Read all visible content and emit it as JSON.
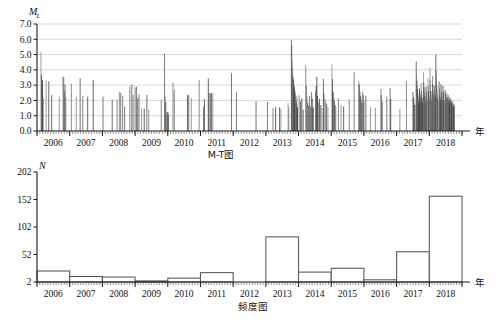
{
  "figure": {
    "x_unit_label": "年",
    "panels": [
      "M-T图",
      "频度图"
    ]
  },
  "chart_data": [
    {
      "type": "scatter",
      "id": "magnitude-time",
      "title": "M-T图",
      "caption": "M-T图",
      "xlabel": "年",
      "ylabel": "M",
      "ylabel_sub": "L",
      "ylim": [
        0,
        7
      ],
      "yticks": [
        "0.0",
        "1.0",
        "2.0",
        "3.0",
        "4.0",
        "5.0",
        "6.0",
        "7.0"
      ],
      "ytick_values": [
        0,
        1,
        2,
        3,
        4,
        5,
        6,
        7
      ],
      "xlim": [
        2005.5,
        2018.5
      ],
      "xticks": [
        "2006",
        "2007",
        "2008",
        "2009",
        "2010",
        "2011",
        "2012",
        "2013",
        "2014",
        "2015",
        "2016",
        "2017",
        "2018"
      ],
      "xtick_values": [
        2006,
        2007,
        2008,
        2009,
        2010,
        2011,
        2012,
        2013,
        2014,
        2015,
        2016,
        2017,
        2018
      ],
      "grid": "horizontal",
      "marker": "vertical-stem",
      "points": [
        [
          2005.62,
          5.15
        ],
        [
          2005.64,
          3.7
        ],
        [
          2005.66,
          3.35
        ],
        [
          2005.67,
          3.3
        ],
        [
          2005.69,
          2.15
        ],
        [
          2005.78,
          3.3
        ],
        [
          2005.86,
          3.25
        ],
        [
          2005.95,
          2.35
        ],
        [
          2006.18,
          2.25
        ],
        [
          2006.3,
          3.55
        ],
        [
          2006.32,
          3.5
        ],
        [
          2006.34,
          2.6
        ],
        [
          2006.36,
          3.05
        ],
        [
          2006.38,
          2.2
        ],
        [
          2006.55,
          3.1
        ],
        [
          2006.7,
          2.25
        ],
        [
          2006.82,
          3.45
        ],
        [
          2006.9,
          2.3
        ],
        [
          2007.05,
          2.25
        ],
        [
          2007.22,
          3.35
        ],
        [
          2007.52,
          2.25
        ],
        [
          2007.8,
          2.05
        ],
        [
          2007.95,
          2.05
        ],
        [
          2008.02,
          2.55
        ],
        [
          2008.06,
          2.5
        ],
        [
          2008.12,
          2.3
        ],
        [
          2008.18,
          1.6
        ],
        [
          2008.34,
          2.9
        ],
        [
          2008.4,
          3.05
        ],
        [
          2008.44,
          2.35
        ],
        [
          2008.5,
          2.85
        ],
        [
          2008.54,
          2.9
        ],
        [
          2008.58,
          2.15
        ],
        [
          2008.62,
          2.4
        ],
        [
          2008.7,
          1.5
        ],
        [
          2008.78,
          1.45
        ],
        [
          2008.86,
          2.35
        ],
        [
          2008.92,
          1.4
        ],
        [
          2009.3,
          2.05
        ],
        [
          2009.4,
          5.05
        ],
        [
          2009.42,
          2.25
        ],
        [
          2009.44,
          1.9
        ],
        [
          2009.46,
          1.25
        ],
        [
          2009.48,
          1.15
        ],
        [
          2009.5,
          1.25
        ],
        [
          2009.52,
          1.1
        ],
        [
          2009.66,
          3.15
        ],
        [
          2009.7,
          2.7
        ],
        [
          2010.1,
          2.35
        ],
        [
          2010.14,
          2.35
        ],
        [
          2010.22,
          2.15
        ],
        [
          2010.46,
          3.35
        ],
        [
          2010.6,
          1.6
        ],
        [
          2010.62,
          2.1
        ],
        [
          2010.74,
          3.45
        ],
        [
          2010.76,
          2.5
        ],
        [
          2010.8,
          2.45
        ],
        [
          2010.84,
          2.5
        ],
        [
          2010.88,
          2.45
        ],
        [
          2011.45,
          3.8
        ],
        [
          2011.6,
          2.55
        ],
        [
          2012.2,
          1.95
        ],
        [
          2012.55,
          1.9
        ],
        [
          2012.72,
          1.5
        ],
        [
          2012.8,
          1.55
        ],
        [
          2012.92,
          1.55
        ],
        [
          2012.96,
          1.45
        ],
        [
          2013.18,
          1.85
        ],
        [
          2013.2,
          1.55
        ],
        [
          2013.28,
          5.95
        ],
        [
          2013.29,
          5.6
        ],
        [
          2013.3,
          4.7
        ],
        [
          2013.31,
          4.2
        ],
        [
          2013.32,
          3.9
        ],
        [
          2013.33,
          3.6
        ],
        [
          2013.34,
          3.4
        ],
        [
          2013.35,
          3.3
        ],
        [
          2013.36,
          3.0
        ],
        [
          2013.37,
          2.9
        ],
        [
          2013.38,
          2.7
        ],
        [
          2013.39,
          2.55
        ],
        [
          2013.4,
          2.4
        ],
        [
          2013.41,
          2.25
        ],
        [
          2013.42,
          2.1
        ],
        [
          2013.43,
          1.95
        ],
        [
          2013.44,
          1.8
        ],
        [
          2013.45,
          2.3
        ],
        [
          2013.46,
          1.6
        ],
        [
          2013.47,
          1.5
        ],
        [
          2013.52,
          2.35
        ],
        [
          2013.56,
          1.95
        ],
        [
          2013.6,
          2.15
        ],
        [
          2013.64,
          1.4
        ],
        [
          2013.72,
          4.3
        ],
        [
          2013.74,
          2.95
        ],
        [
          2013.76,
          2.25
        ],
        [
          2013.78,
          1.9
        ],
        [
          2013.8,
          1.7
        ],
        [
          2013.84,
          2.3
        ],
        [
          2013.86,
          1.6
        ],
        [
          2013.9,
          2.55
        ],
        [
          2013.92,
          2.1
        ],
        [
          2013.94,
          1.55
        ],
        [
          2013.96,
          1.5
        ],
        [
          2014.02,
          2.6
        ],
        [
          2014.04,
          2.95
        ],
        [
          2014.06,
          3.55
        ],
        [
          2014.08,
          2.3
        ],
        [
          2014.1,
          1.85
        ],
        [
          2014.14,
          2.1
        ],
        [
          2014.18,
          1.7
        ],
        [
          2014.22,
          1.5
        ],
        [
          2014.26,
          3.4
        ],
        [
          2014.28,
          2.45
        ],
        [
          2014.32,
          2.05
        ],
        [
          2014.36,
          1.8
        ],
        [
          2014.4,
          1.55
        ],
        [
          2014.52,
          4.35
        ],
        [
          2014.54,
          3.4
        ],
        [
          2014.56,
          2.55
        ],
        [
          2014.58,
          2.2
        ],
        [
          2014.6,
          1.95
        ],
        [
          2014.62,
          1.7
        ],
        [
          2014.64,
          1.55
        ],
        [
          2014.72,
          2.15
        ],
        [
          2014.8,
          1.7
        ],
        [
          2014.88,
          1.6
        ],
        [
          2015.05,
          2.05
        ],
        [
          2015.2,
          3.85
        ],
        [
          2015.34,
          3.25
        ],
        [
          2015.36,
          3.05
        ],
        [
          2015.38,
          2.55
        ],
        [
          2015.4,
          2.3
        ],
        [
          2015.42,
          2.1
        ],
        [
          2015.44,
          1.85
        ],
        [
          2015.46,
          2.6
        ],
        [
          2015.48,
          2.35
        ],
        [
          2015.5,
          1.95
        ],
        [
          2015.56,
          2.3
        ],
        [
          2015.7,
          1.55
        ],
        [
          2015.85,
          1.5
        ],
        [
          2016.02,
          2.75
        ],
        [
          2016.04,
          2.35
        ],
        [
          2016.06,
          1.9
        ],
        [
          2016.2,
          2.25
        ],
        [
          2016.3,
          2.8
        ],
        [
          2016.32,
          2.1
        ],
        [
          2016.6,
          1.45
        ],
        [
          2016.8,
          3.25
        ],
        [
          2017.0,
          2.55
        ],
        [
          2017.02,
          2.2
        ],
        [
          2017.04,
          1.85
        ],
        [
          2017.06,
          1.7
        ],
        [
          2017.1,
          4.55
        ],
        [
          2017.11,
          3.7
        ],
        [
          2017.12,
          3.3
        ],
        [
          2017.13,
          3.0
        ],
        [
          2017.14,
          2.7
        ],
        [
          2017.15,
          2.45
        ],
        [
          2017.16,
          2.25
        ],
        [
          2017.17,
          2.05
        ],
        [
          2017.18,
          1.9
        ],
        [
          2017.19,
          1.75
        ],
        [
          2017.2,
          2.8
        ],
        [
          2017.21,
          2.5
        ],
        [
          2017.22,
          2.3
        ],
        [
          2017.23,
          2.1
        ],
        [
          2017.24,
          1.95
        ],
        [
          2017.25,
          3.15
        ],
        [
          2017.26,
          2.6
        ],
        [
          2017.27,
          2.35
        ],
        [
          2017.28,
          2.15
        ],
        [
          2017.29,
          1.85
        ],
        [
          2017.32,
          3.85
        ],
        [
          2017.33,
          3.2
        ],
        [
          2017.34,
          2.85
        ],
        [
          2017.35,
          2.5
        ],
        [
          2017.36,
          2.25
        ],
        [
          2017.37,
          2.0
        ],
        [
          2017.38,
          1.8
        ],
        [
          2017.4,
          2.9
        ],
        [
          2017.41,
          2.55
        ],
        [
          2017.42,
          2.3
        ],
        [
          2017.43,
          2.05
        ],
        [
          2017.44,
          1.85
        ],
        [
          2017.46,
          3.45
        ],
        [
          2017.47,
          2.95
        ],
        [
          2017.48,
          2.6
        ],
        [
          2017.49,
          2.3
        ],
        [
          2017.5,
          2.05
        ],
        [
          2017.52,
          4.15
        ],
        [
          2017.53,
          3.35
        ],
        [
          2017.54,
          2.95
        ],
        [
          2017.55,
          2.6
        ],
        [
          2017.56,
          2.35
        ],
        [
          2017.57,
          2.1
        ],
        [
          2017.58,
          1.9
        ],
        [
          2017.6,
          3.6
        ],
        [
          2017.61,
          3.05
        ],
        [
          2017.62,
          2.7
        ],
        [
          2017.63,
          2.4
        ],
        [
          2017.64,
          2.15
        ],
        [
          2017.66,
          2.95
        ],
        [
          2017.67,
          2.55
        ],
        [
          2017.68,
          2.25
        ],
        [
          2017.7,
          5.0
        ],
        [
          2017.71,
          3.95
        ],
        [
          2017.72,
          3.35
        ],
        [
          2017.73,
          2.95
        ],
        [
          2017.74,
          2.6
        ],
        [
          2017.75,
          2.35
        ],
        [
          2017.76,
          2.1
        ],
        [
          2017.77,
          1.9
        ],
        [
          2017.8,
          3.25
        ],
        [
          2017.81,
          2.8
        ],
        [
          2017.82,
          2.45
        ],
        [
          2017.83,
          2.2
        ],
        [
          2017.84,
          2.0
        ],
        [
          2017.86,
          3.05
        ],
        [
          2017.87,
          2.6
        ],
        [
          2017.88,
          2.3
        ],
        [
          2017.89,
          2.05
        ],
        [
          2017.9,
          1.85
        ],
        [
          2017.92,
          2.95
        ],
        [
          2017.93,
          2.55
        ],
        [
          2017.94,
          2.25
        ],
        [
          2017.95,
          2.0
        ],
        [
          2017.96,
          1.8
        ],
        [
          2017.98,
          2.7
        ],
        [
          2017.99,
          2.4
        ],
        [
          2018.0,
          2.6
        ],
        [
          2018.01,
          2.3
        ],
        [
          2018.02,
          2.05
        ],
        [
          2018.03,
          1.85
        ],
        [
          2018.04,
          2.45
        ],
        [
          2018.05,
          2.2
        ],
        [
          2018.06,
          2.0
        ],
        [
          2018.07,
          1.8
        ],
        [
          2018.08,
          2.35
        ],
        [
          2018.09,
          2.1
        ],
        [
          2018.1,
          1.9
        ],
        [
          2018.11,
          2.25
        ],
        [
          2018.12,
          2.0
        ],
        [
          2018.13,
          1.8
        ],
        [
          2018.14,
          2.15
        ],
        [
          2018.15,
          1.95
        ],
        [
          2018.16,
          1.75
        ],
        [
          2018.17,
          2.05
        ],
        [
          2018.18,
          1.85
        ],
        [
          2018.19,
          1.7
        ],
        [
          2018.2,
          1.95
        ],
        [
          2018.21,
          1.75
        ],
        [
          2018.22,
          1.6
        ],
        [
          2018.23,
          1.85
        ],
        [
          2018.24,
          1.65
        ],
        [
          2018.25,
          1.55
        ],
        [
          2018.26,
          1.75
        ],
        [
          2018.27,
          1.6
        ]
      ]
    },
    {
      "type": "bar",
      "id": "frequency-histogram",
      "title": "频度图",
      "caption": "频度图",
      "xlabel": "年",
      "ylabel": "N",
      "ylim": [
        2,
        202
      ],
      "yticks": [
        "2",
        "52",
        "102",
        "152",
        "202"
      ],
      "ytick_values": [
        2,
        52,
        102,
        152,
        202
      ],
      "categories": [
        "2006",
        "2007",
        "2008",
        "2009",
        "2010",
        "2011",
        "2012",
        "2013",
        "2014",
        "2015",
        "2016",
        "2017",
        "2018"
      ],
      "values": [
        22,
        12,
        11,
        4,
        9,
        19,
        0,
        84,
        20,
        27,
        6,
        57,
        158
      ],
      "grid": "none"
    }
  ]
}
